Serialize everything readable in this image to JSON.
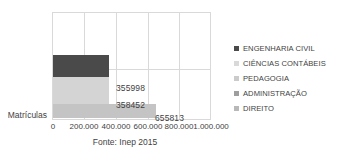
{
  "chart_data": {
    "type": "bar",
    "orientation": "horizontal",
    "title": "",
    "xlabel": "",
    "ylabel": "Matrículas",
    "categories": [
      "Matrículas"
    ],
    "xlim": [
      0,
      1000000
    ],
    "grid": true,
    "legend_position": "right",
    "xticks": [
      {
        "value": 0,
        "label": "0"
      },
      {
        "value": 200000,
        "label": "200.000"
      },
      {
        "value": 400000,
        "label": "400.000"
      },
      {
        "value": 600000,
        "label": "600.000"
      },
      {
        "value": 800000,
        "label": "800.000"
      },
      {
        "value": 1000000,
        "label": "1.000.000"
      }
    ],
    "series": [
      {
        "name": "ENGENHARIA CIVIL",
        "value": 355998,
        "label": "355998",
        "color": "#4a4a4a"
      },
      {
        "name": "CIÊNCIAS CONTÁBEIS",
        "value": 358452,
        "label": "358452",
        "color": "#d4d4d4"
      },
      {
        "name": "PEDAGOGIA",
        "value": null,
        "label": "",
        "color": "#cfcfcf"
      },
      {
        "name": "ADMINISTRAÇÃO",
        "value": null,
        "label": "",
        "color": "#9a9a9a"
      },
      {
        "name": "DIREITO",
        "value": 655813,
        "label": "655813",
        "color": "#c4c4c4"
      }
    ],
    "caption": "Fonte: Inep 2015"
  },
  "legend": {
    "items": [
      {
        "label": "ENGENHARIA CIVIL",
        "color": "#4a4a4a"
      },
      {
        "label": "CIÊNCIAS CONTÁBEIS",
        "color": "#d9d9d9"
      },
      {
        "label": "PEDAGOGIA",
        "color": "#cbcbcb"
      },
      {
        "label": "ADMINISTRAÇÃO",
        "color": "#9e9e9e"
      },
      {
        "label": "DIREITO",
        "color": "#b8b8b8"
      }
    ]
  },
  "axis": {
    "category_label": "Matrículas"
  },
  "footer": {
    "source": "Fonte: Inep 2015"
  }
}
